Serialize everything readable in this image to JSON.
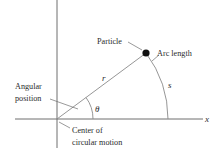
{
  "diagram": {
    "labels": {
      "particle": "Particle",
      "arc_length": "Arc length",
      "angular_position_line1": "Angular",
      "angular_position_line2": "position",
      "center_line1": "Center of",
      "center_line2": "circular motion",
      "radius_symbol": "r",
      "arc_symbol": "s",
      "angle_symbol": "θ",
      "x_axis": "x"
    },
    "geometry": {
      "origin": [
        57,
        119
      ],
      "particle": [
        146,
        53
      ],
      "radius_px": 111,
      "theta_arc_radius_px": 36
    },
    "colors": {
      "ink": "#2b2b2b",
      "axis": "#6e6e6e",
      "particle": "#111111",
      "background": "#ffffff"
    }
  }
}
